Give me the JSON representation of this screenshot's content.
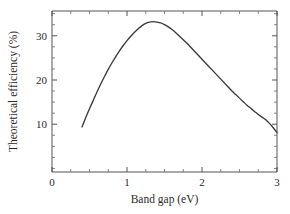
{
  "figure": {
    "background_color": "#ffffff",
    "width": 290,
    "height": 214
  },
  "chart_data": {
    "type": "line",
    "title": "",
    "subtitle": "",
    "xlabel": "Band gap (eV)",
    "ylabel": "Theoretical efficiency (%)",
    "xlim": [
      0,
      3
    ],
    "ylim": [
      -0.8,
      35.6
    ],
    "grid": false,
    "legend": null,
    "legend_position": "none",
    "line_color": "#3a3a3a",
    "x_major_ticks": [
      0,
      1,
      2,
      3
    ],
    "x_major_tick_labels": [
      "0",
      "1",
      "2",
      "3"
    ],
    "x_minor_tick_step": 0.25,
    "y_major_ticks": [
      10,
      20,
      30
    ],
    "y_major_tick_labels": [
      "10",
      "20",
      "30"
    ],
    "y_minor_tick_step": 2.5,
    "annotations": [],
    "series": [
      {
        "name": "Theoretical efficiency",
        "x": [
          0.4,
          0.45,
          0.5,
          0.55,
          0.6,
          0.65,
          0.7,
          0.75,
          0.8,
          0.85,
          0.9,
          0.95,
          1.0,
          1.05,
          1.1,
          1.15,
          1.2,
          1.25,
          1.3,
          1.35,
          1.4,
          1.45,
          1.5,
          1.55,
          1.6,
          1.65,
          1.7,
          1.75,
          1.8,
          1.85,
          1.9,
          1.95,
          2.0,
          2.05,
          2.1,
          2.15,
          2.2,
          2.25,
          2.3,
          2.35,
          2.4,
          2.45,
          2.5,
          2.55,
          2.6,
          2.65,
          2.7,
          2.75,
          2.8,
          2.85,
          2.9,
          2.95,
          3.0
        ],
        "y": [
          9.4,
          11.5,
          13.5,
          15.4,
          17.3,
          19.1,
          20.8,
          22.4,
          23.9,
          25.3,
          26.6,
          27.8,
          28.9,
          29.9,
          30.8,
          31.6,
          32.3,
          32.8,
          33.1,
          33.2,
          33.1,
          32.9,
          32.5,
          32.0,
          31.4,
          30.7,
          29.9,
          29.1,
          28.3,
          27.4,
          26.5,
          25.6,
          24.7,
          23.8,
          22.9,
          22.0,
          21.1,
          20.2,
          19.3,
          18.4,
          17.5,
          16.7,
          15.9,
          15.1,
          14.3,
          13.6,
          12.9,
          12.2,
          11.6,
          11.0,
          10.2,
          9.2,
          8.1
        ]
      }
    ],
    "peak": {
      "x": 1.35,
      "y": 33.2
    }
  }
}
